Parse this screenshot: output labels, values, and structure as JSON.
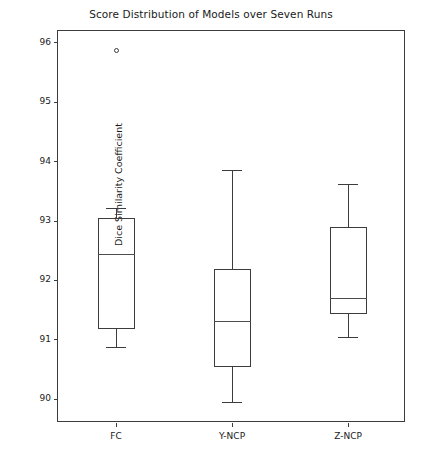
{
  "chart_data": {
    "type": "box",
    "title": "Score Distribution of Models over Seven Runs",
    "xlabel": "",
    "ylabel": "Dice Similarity Coefficient",
    "categories": [
      "FC",
      "Y-NCP",
      "Z-NCP"
    ],
    "ylim": [
      89.6,
      96.2
    ],
    "yticks": [
      90,
      91,
      92,
      93,
      94,
      95,
      96
    ],
    "ytick_labels": [
      "90",
      "91",
      "92",
      "93",
      "94",
      "95",
      "96"
    ],
    "grid": false,
    "legend": "none",
    "series": [
      {
        "name": "FC",
        "whisker_low": 90.88,
        "q1": 91.19,
        "median": 92.44,
        "q3": 93.05,
        "whisker_high": 93.22,
        "outliers": [
          95.87
        ]
      },
      {
        "name": "Y-NCP",
        "whisker_low": 89.96,
        "q1": 90.54,
        "median": 91.31,
        "q3": 92.2,
        "whisker_high": 93.86,
        "outliers": []
      },
      {
        "name": "Z-NCP",
        "whisker_low": 91.05,
        "q1": 91.43,
        "median": 91.7,
        "q3": 92.9,
        "whisker_high": 93.62,
        "outliers": []
      }
    ],
    "colors": {
      "box_edge": "#3c3c3c",
      "median": "#4d4d4d",
      "whisker": "#3c3c3c",
      "flier_edge": "#3c3c3c",
      "axes_edge": "#3c3c3c",
      "background": "#ffffff",
      "text": "#1a1a1a"
    }
  }
}
